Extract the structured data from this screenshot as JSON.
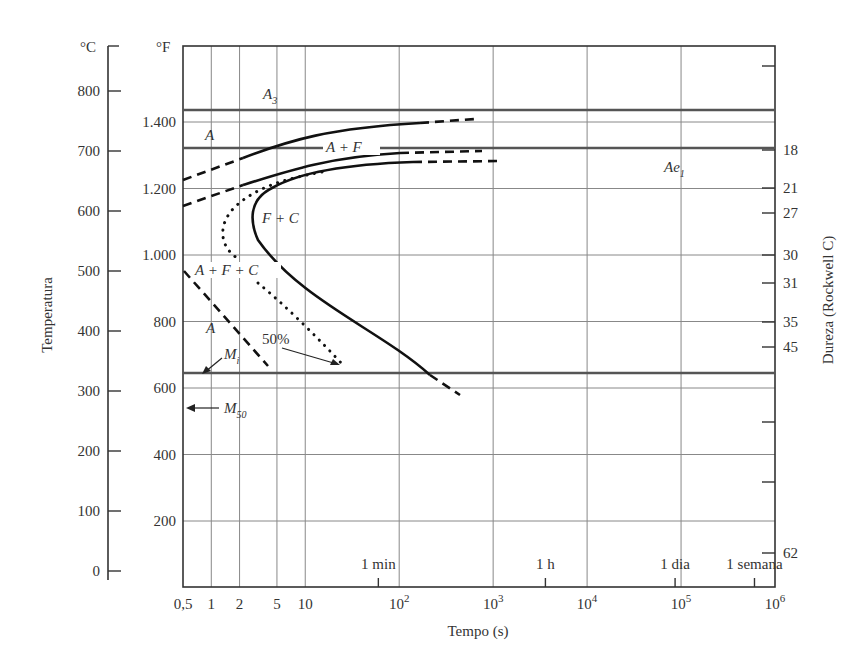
{
  "chart_data": {
    "type": "line",
    "title": "",
    "xlabel": "Tempo (s)",
    "ylabel_left": "Temperatura",
    "ylabel_right": "Dureza (Rockwell C)",
    "x_scale": "log",
    "xlim": [
      0.5,
      1000000
    ],
    "x_tick_labels": [
      "0,5",
      "1",
      "2",
      "5",
      "10",
      "10^2",
      "10^3",
      "10^4",
      "10^5",
      "10^6"
    ],
    "x_tick_values": [
      0.5,
      1,
      2,
      5,
      10,
      100,
      1000,
      10000,
      100000,
      1000000
    ],
    "time_markers": [
      {
        "label": "1 min",
        "value_s": 60
      },
      {
        "label": "1 h",
        "value_s": 3600
      },
      {
        "label": "1 dia",
        "value_s": 86400
      },
      {
        "label": "1 semana",
        "value_s": 604800
      }
    ],
    "y_celsius": {
      "unit": "°C",
      "ticks": [
        0,
        100,
        200,
        300,
        400,
        500,
        600,
        700,
        800
      ],
      "ylim": [
        0,
        850
      ]
    },
    "y_fahrenheit": {
      "unit": "°F",
      "ticks": [
        "200",
        "400",
        "600",
        "800",
        "1.000",
        "1.200",
        "1.400"
      ],
      "tick_values": [
        200,
        400,
        600,
        800,
        1000,
        1200,
        1400
      ]
    },
    "hardness_ticks": [
      "18",
      "21",
      "27",
      "30",
      "31",
      "35",
      "45",
      "62"
    ],
    "horizontal_lines": [
      {
        "name": "A3",
        "label": "A₃",
        "temp_F": 1435
      },
      {
        "name": "Ae1",
        "label": "Ae₁",
        "temp_F": 1325
      },
      {
        "name": "Mi",
        "label": "Mᵢ",
        "temp_F": 645
      },
      {
        "name": "M50",
        "label": "M₅₀",
        "temp_F": 540
      }
    ],
    "regions": [
      "A",
      "A + F",
      "F + C",
      "A + F + C",
      "A",
      "50%"
    ],
    "series": [
      {
        "name": "Início A→F (superior)",
        "style": "solid/dashed",
        "points_s_F": [
          [
            0.5,
            1235
          ],
          [
            1.5,
            1290
          ],
          [
            5,
            1330
          ],
          [
            30,
            1370
          ],
          [
            200,
            1405
          ],
          [
            500,
            1415
          ]
        ]
      },
      {
        "name": "Início F→C",
        "style": "solid/dashed",
        "points_s_F": [
          [
            0.5,
            1160
          ],
          [
            1.5,
            1210
          ],
          [
            5,
            1250
          ],
          [
            100,
            1300
          ],
          [
            500,
            1310
          ]
        ]
      },
      {
        "name": "Fim transformação",
        "style": "solid",
        "points_s_F": [
          [
            1000,
            1280
          ],
          [
            100,
            1270
          ],
          [
            10,
            1200
          ],
          [
            4,
            1140
          ],
          [
            3.5,
            1100
          ],
          [
            5,
            1000
          ],
          [
            20,
            870
          ],
          [
            150,
            680
          ],
          [
            400,
            590
          ]
        ]
      },
      {
        "name": "50% transformação",
        "style": "dotted",
        "points_s_F": [
          [
            25,
            1200
          ],
          [
            5,
            1180
          ],
          [
            2,
            1120
          ],
          [
            1.5,
            1050
          ],
          [
            2,
            1000
          ],
          [
            5,
            940
          ],
          [
            30,
            680
          ]
        ]
      },
      {
        "name": "Início martensita (A)",
        "style": "dashed",
        "points_s_F": [
          [
            0.5,
            965
          ],
          [
            1,
            880
          ],
          [
            3,
            700
          ],
          [
            4,
            660
          ]
        ]
      }
    ]
  },
  "labels": {
    "unit_c": "°C",
    "unit_f": "°F",
    "xlabel": "Tempo (s)",
    "ylabel_left": "Temperatura",
    "ylabel_right": "Dureza (Rockwell C)",
    "region_a_top": "A",
    "region_af": "A + F",
    "region_fc": "F + C",
    "region_afc": "A + F + C",
    "region_a_low": "A",
    "pct50": "50%",
    "a3": "A",
    "a3_sub": "3",
    "ae1": "Ae",
    "ae1_sub": "1",
    "mi": "M",
    "mi_sub": "i",
    "m50": "M",
    "m50_sub": "50",
    "min1": "1 min",
    "h1": "1 h",
    "dia1": "1 dia",
    "semana1": "1 semana"
  }
}
